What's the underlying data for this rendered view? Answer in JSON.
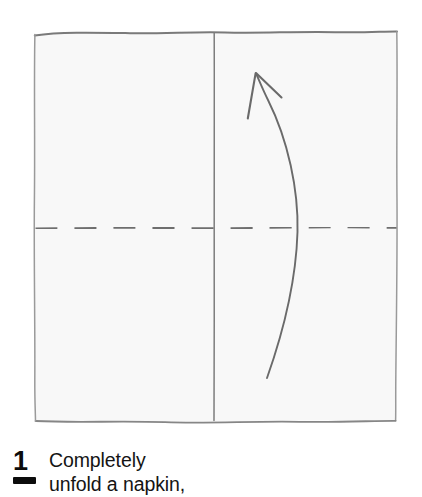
{
  "diagram": {
    "napkin": {
      "label": "napkin",
      "fill_color": "#f8f8f8",
      "outline_color": "#8f8f8f",
      "outline_width": 1.6
    },
    "creases": [
      {
        "name": "vertical-crease",
        "style": "solid",
        "color": "#7d7d7d",
        "orientation": "vertical",
        "position_x": 214
      },
      {
        "name": "horizontal-crease",
        "style": "dashed",
        "color": "#6e6e6e",
        "orientation": "horizontal",
        "position_y": 228,
        "dash_length": 22,
        "gap_length": 17
      }
    ],
    "arrow": {
      "name": "curved-rotation-arrow",
      "color": "#6b6b6b",
      "direction": "upward",
      "tip_x": 256,
      "tip_y": 73,
      "tail_x": 267,
      "tail_y": 378
    }
  },
  "caption": {
    "step_number": "1",
    "text": "Completely\nunfold a napkin,"
  }
}
